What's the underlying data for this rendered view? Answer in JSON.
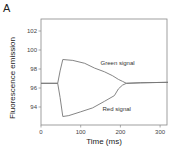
{
  "panel_label": "A",
  "chart_data": {
    "type": "line",
    "title": "",
    "xlabel": "Time (ms)",
    "ylabel": "Fluorescence emission",
    "xlim": [
      0,
      320
    ],
    "ylim": [
      92.7,
      103.8
    ],
    "x_ticks": [
      0,
      100,
      200,
      300
    ],
    "y_ticks": [
      94,
      96,
      98,
      100,
      102
    ],
    "grid": false,
    "legend": "none (inline annotations)",
    "annotations": [
      {
        "text": "Green signal",
        "x": 150,
        "y": 98.4
      },
      {
        "text": "Red signal",
        "x": 155,
        "y": 93.6
      }
    ],
    "series": [
      {
        "name": "Green signal",
        "color": "#777777",
        "points": [
          [
            0,
            96.5
          ],
          [
            42,
            96.5
          ],
          [
            48,
            97.8
          ],
          [
            55,
            99.0
          ],
          [
            80,
            98.9
          ],
          [
            110,
            98.6
          ],
          [
            135,
            98.1
          ],
          [
            160,
            97.7
          ],
          [
            180,
            97.3
          ],
          [
            195,
            96.9
          ],
          [
            205,
            96.7
          ],
          [
            215,
            96.5
          ],
          [
            250,
            96.55
          ],
          [
            320,
            96.6
          ]
        ]
      },
      {
        "name": "Red signal",
        "color": "#777777",
        "points": [
          [
            0,
            96.5
          ],
          [
            42,
            96.5
          ],
          [
            48,
            95.0
          ],
          [
            55,
            93.0
          ],
          [
            70,
            93.1
          ],
          [
            100,
            93.5
          ],
          [
            130,
            93.9
          ],
          [
            160,
            94.6
          ],
          [
            185,
            95.2
          ],
          [
            195,
            95.9
          ],
          [
            205,
            96.3
          ],
          [
            215,
            96.5
          ],
          [
            250,
            96.55
          ],
          [
            320,
            96.6
          ]
        ]
      }
    ]
  }
}
